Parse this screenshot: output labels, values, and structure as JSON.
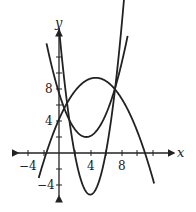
{
  "chart_data": {
    "type": "line",
    "title": "",
    "xlabel": "x",
    "ylabel": "y",
    "xlim": [
      -5,
      13
    ],
    "ylim": [
      -5.5,
      12
    ],
    "x_ticks": [
      -4,
      4,
      8
    ],
    "y_ticks": [
      -4,
      4,
      8
    ],
    "grid": false,
    "series": [
      {
        "name": "f1",
        "formula": "-0.235*(x-4.7)^2 + 9.4",
        "vertex": [
          4.7,
          9.4
        ],
        "roots": [
          -1.6,
          11
        ]
      },
      {
        "name": "f2",
        "formula": "0.45*(x-3.5)^2 + 2",
        "vertex": [
          3.5,
          2
        ]
      },
      {
        "name": "f3",
        "formula": "1.3*(x-4)^2 - 5.2",
        "vertex": [
          4,
          -5.2
        ],
        "roots": [
          2,
          6
        ]
      }
    ]
  },
  "labels": {
    "x_axis": "x",
    "y_axis": "y",
    "tick_x_neg4": "−4",
    "tick_x_4": "4",
    "tick_x_8": "8",
    "tick_y_8": "8",
    "tick_y_4": "4",
    "tick_y_neg4": "−4"
  }
}
